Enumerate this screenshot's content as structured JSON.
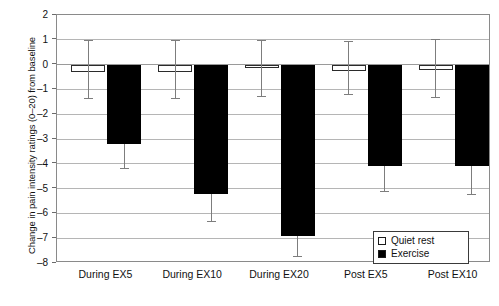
{
  "chart_data": {
    "type": "bar",
    "title": "",
    "xlabel": "",
    "ylabel": "Change in pain intensity ratings (0–20) from baseline",
    "ylim": [
      -8,
      2
    ],
    "ytick_labels": [
      "2",
      "1",
      "0",
      "–1",
      "–2",
      "–3",
      "–4",
      "–5",
      "–6",
      "–7",
      "–8"
    ],
    "ytick_values": [
      2,
      1,
      0,
      -1,
      -2,
      -3,
      -4,
      -5,
      -6,
      -7,
      -8
    ],
    "grid": true,
    "legend_position": "lower-right",
    "categories": [
      "During EX5",
      "During EX10",
      "During EX20",
      "Post EX5",
      "Post EX10"
    ],
    "series": [
      {
        "name": "Quiet rest",
        "fill": "#ffffff",
        "edge": "#2b2b2b",
        "values": [
          -0.3,
          -0.3,
          -0.15,
          -0.25,
          -0.2
        ],
        "err_upper": [
          1.0,
          1.0,
          1.0,
          0.95,
          1.05
        ],
        "err_lower": [
          -1.35,
          -1.35,
          -1.25,
          -1.2,
          -1.3
        ]
      },
      {
        "name": "Exercise",
        "fill": "#000000",
        "edge": "#000000",
        "values": [
          -3.2,
          -5.2,
          -6.9,
          -4.1,
          -4.1
        ],
        "err_upper": [
          -3.2,
          -5.2,
          -6.9,
          -4.1,
          -4.1
        ],
        "err_lower": [
          -4.15,
          -6.3,
          -7.7,
          -5.1,
          -5.2
        ]
      }
    ]
  },
  "legend": {
    "items": [
      {
        "label": "Quiet rest",
        "marker": "open-square"
      },
      {
        "label": "Exercise",
        "marker": "filled-square"
      }
    ]
  }
}
